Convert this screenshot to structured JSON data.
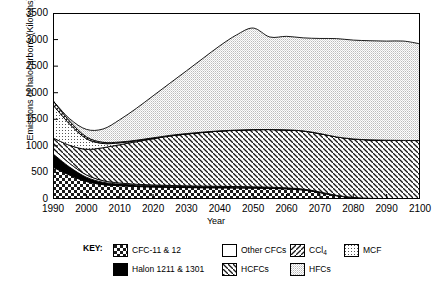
{
  "chart_data": {
    "type": "area",
    "stacked": true,
    "title": "",
    "xlabel": "Year",
    "ylabel": "Emissions of halocarbons (Kilotons)",
    "xlim": [
      1990,
      2100
    ],
    "ylim": [
      0,
      3500
    ],
    "ytick_labels": [
      "0",
      "500",
      "1000",
      "1500",
      "2000",
      "2500",
      "3000",
      "3500"
    ],
    "ytick_values": [
      0,
      500,
      1000,
      1500,
      2000,
      2500,
      3000,
      3500
    ],
    "xtick_labels": [
      "1990",
      "2000",
      "2010",
      "2020",
      "2030",
      "2040",
      "2050",
      "2060",
      "2070",
      "2080",
      "2090",
      "2100"
    ],
    "xtick_values": [
      1990,
      2000,
      2010,
      2020,
      2030,
      2040,
      2050,
      2060,
      2070,
      2080,
      2090,
      2100
    ],
    "grid": false,
    "legend_position": "bottom",
    "x": [
      1990,
      1995,
      2000,
      2005,
      2010,
      2015,
      2020,
      2025,
      2030,
      2035,
      2040,
      2045,
      2050,
      2055,
      2060,
      2065,
      2070,
      2075,
      2080,
      2085,
      2090,
      2095,
      2100
    ],
    "series": [
      {
        "name": "CFC-11 & 12",
        "fill": "checkerboard",
        "values": [
          600,
          450,
          330,
          270,
          250,
          235,
          225,
          220,
          215,
          212,
          210,
          208,
          205,
          200,
          190,
          170,
          120,
          60,
          25,
          10,
          5,
          2,
          0
        ]
      },
      {
        "name": "Halon 1211 & 1301",
        "fill": "solid-black",
        "values": [
          250,
          150,
          80,
          45,
          30,
          25,
          22,
          20,
          18,
          17,
          16,
          15,
          14,
          13,
          12,
          10,
          8,
          5,
          3,
          2,
          1,
          0,
          0
        ]
      },
      {
        "name": "Other CFCs",
        "fill": "white",
        "values": [
          100,
          70,
          45,
          30,
          22,
          18,
          16,
          15,
          14,
          13,
          12,
          11,
          10,
          9,
          8,
          7,
          5,
          3,
          2,
          1,
          0,
          0,
          0
        ]
      },
      {
        "name": "HCFCs",
        "fill": "backslash-hatch",
        "values": [
          200,
          340,
          480,
          620,
          720,
          800,
          870,
          930,
          975,
          1010,
          1040,
          1060,
          1075,
          1085,
          1090,
          1095,
          1098,
          1100,
          1100,
          1100,
          1100,
          1100,
          1100
        ]
      },
      {
        "name": "MCF",
        "fill": "fine-dots",
        "values": [
          620,
          400,
          200,
          80,
          35,
          18,
          10,
          6,
          4,
          3,
          2,
          1,
          1,
          0,
          0,
          0,
          0,
          0,
          0,
          0,
          0,
          0,
          0
        ]
      },
      {
        "name": "CCl4",
        "fill": "forwardslash-hatch",
        "values": [
          80,
          55,
          35,
          22,
          15,
          10,
          8,
          6,
          5,
          4,
          3,
          2,
          2,
          1,
          1,
          0,
          0,
          0,
          0,
          0,
          0,
          0,
          0
        ]
      },
      {
        "name": "HFCs",
        "fill": "light-stipple",
        "values": [
          0,
          45,
          140,
          250,
          420,
          600,
          790,
          980,
          1180,
          1390,
          1600,
          1790,
          1910,
          1740,
          1760,
          1750,
          1790,
          1850,
          1860,
          1865,
          1865,
          1870,
          1820
        ]
      }
    ],
    "totals": [
      1850,
      1510,
      1310,
      1317,
      1492,
      1706,
      1941,
      2177,
      2411,
      2649,
      2883,
      3087,
      3217,
      3048,
      3061,
      3032,
      3021,
      3018,
      2990,
      2978,
      2971,
      2972,
      2920
    ]
  },
  "legend": {
    "key_label": "KEY:",
    "entries": [
      {
        "label": "CFC-11 & 12",
        "fill": "checkerboard"
      },
      {
        "label": "Other CFCs",
        "fill": "white"
      },
      {
        "label": "CCl",
        "sub": "4",
        "fill": "forwardslash-hatch"
      },
      {
        "label": "MCF",
        "fill": "fine-dots"
      },
      {
        "label": "Halon 1211 & 1301",
        "fill": "solid-black"
      },
      {
        "label": "HCFCs",
        "fill": "backslash-hatch"
      },
      {
        "label": "HFCs",
        "fill": "light-stipple"
      }
    ]
  }
}
